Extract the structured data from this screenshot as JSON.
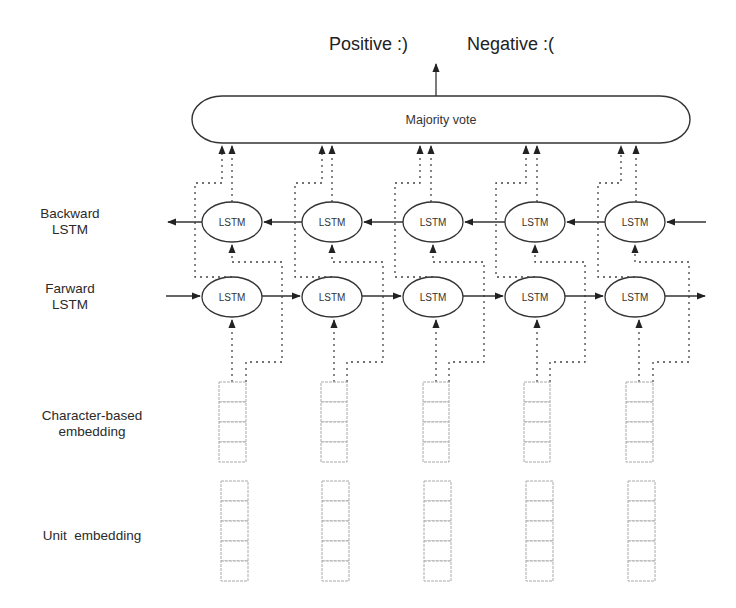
{
  "outputs": {
    "positive": "Positive :)",
    "negative": "Negative :("
  },
  "aggregator": {
    "label": "Majority vote"
  },
  "layers": {
    "backward": {
      "line1": "Backward",
      "line2": "LSTM"
    },
    "forward": {
      "line1": "Farward",
      "line2": "LSTM"
    },
    "char_embedding": {
      "line1": "Character-based",
      "line2": "embedding"
    },
    "unit_embedding": {
      "line1": "Unit  embedding"
    }
  },
  "cells": {
    "lstm_label": "LSTM"
  },
  "columns": [
    {
      "index": 1,
      "backward_cell": "LSTM",
      "forward_cell": "LSTM",
      "char_embedding_slots": 4,
      "unit_embedding_slots": 5
    },
    {
      "index": 2,
      "backward_cell": "LSTM",
      "forward_cell": "LSTM",
      "char_embedding_slots": 4,
      "unit_embedding_slots": 5
    },
    {
      "index": 3,
      "backward_cell": "LSTM",
      "forward_cell": "LSTM",
      "char_embedding_slots": 4,
      "unit_embedding_slots": 5
    },
    {
      "index": 4,
      "backward_cell": "LSTM",
      "forward_cell": "LSTM",
      "char_embedding_slots": 4,
      "unit_embedding_slots": 5
    },
    {
      "index": 5,
      "backward_cell": "LSTM",
      "forward_cell": "LSTM",
      "char_embedding_slots": 4,
      "unit_embedding_slots": 5
    }
  ],
  "colors": {
    "stroke": "#333333",
    "dotted": "#444444",
    "embedding_box": "#aaaaaa"
  }
}
